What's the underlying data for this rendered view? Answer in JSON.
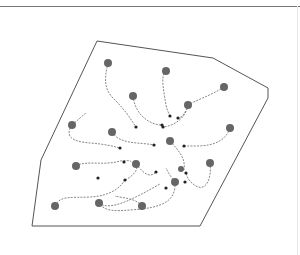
{
  "diagram": {
    "colors": {
      "boundary": "#555555",
      "path": "#888888",
      "source": "#666666",
      "sink": "#222222",
      "rule": "#777777"
    },
    "boundary_polygon": [
      [
        97,
        41
      ],
      [
        213,
        58
      ],
      [
        268,
        88
      ],
      [
        268,
        98
      ],
      [
        200,
        226
      ],
      [
        32,
        226
      ],
      [
        41,
        160
      ]
    ],
    "sources": [
      {
        "x": 108,
        "y": 63,
        "r": 4
      },
      {
        "x": 166,
        "y": 71,
        "r": 4
      },
      {
        "x": 133,
        "y": 96,
        "r": 4
      },
      {
        "x": 224,
        "y": 87,
        "r": 4
      },
      {
        "x": 188,
        "y": 105,
        "r": 4
      },
      {
        "x": 72,
        "y": 125,
        "r": 4
      },
      {
        "x": 112,
        "y": 132,
        "r": 4
      },
      {
        "x": 170,
        "y": 141,
        "r": 4
      },
      {
        "x": 230,
        "y": 128,
        "r": 4
      },
      {
        "x": 76,
        "y": 166,
        "r": 4
      },
      {
        "x": 136,
        "y": 164,
        "r": 4
      },
      {
        "x": 210,
        "y": 163,
        "r": 4
      },
      {
        "x": 55,
        "y": 206,
        "r": 4
      },
      {
        "x": 99,
        "y": 203,
        "r": 4
      },
      {
        "x": 142,
        "y": 206,
        "r": 4
      },
      {
        "x": 175,
        "y": 182,
        "r": 4
      },
      {
        "x": 181,
        "y": 169,
        "r": 3
      }
    ],
    "sinks": [
      {
        "x": 136,
        "y": 127
      },
      {
        "x": 162,
        "y": 125
      },
      {
        "x": 170,
        "y": 116
      },
      {
        "x": 178,
        "y": 118
      },
      {
        "x": 163,
        "y": 127
      },
      {
        "x": 120,
        "y": 148
      },
      {
        "x": 154,
        "y": 145
      },
      {
        "x": 184,
        "y": 146
      },
      {
        "x": 125,
        "y": 180
      },
      {
        "x": 186,
        "y": 173
      },
      {
        "x": 185,
        "y": 182
      },
      {
        "x": 166,
        "y": 188
      },
      {
        "x": 156,
        "y": 172
      },
      {
        "x": 98,
        "y": 178
      },
      {
        "x": 124,
        "y": 162
      }
    ],
    "paths": [
      "M108,63 C104,80 104,90 115,100 C125,110 130,118 136,127",
      "M166,71 C160,75 164,92 166,105 C167,110 169,114 170,116",
      "M133,96 C135,115 150,125 162,125",
      "M224,87 C210,96 196,100 188,105",
      "M188,105 C186,112 182,118 178,118",
      "M188,105 C186,118 174,126 163,127",
      "M72,125 C78,120 82,116 86,113",
      "M72,125 C62,140 80,142 90,143 C104,144 112,146 120,148",
      "M112,132 C120,145 140,142 154,145",
      "M230,128 C226,140 215,146 196,146 L184,146",
      "M170,141 C178,150 186,158 184,170",
      "M76,166 C86,160 104,166 120,161 C130,160 131,161 131,162",
      "M136,164 C145,175 150,178 156,172",
      "M136,164 C140,170 130,178 125,180",
      "M210,163 C212,178 206,192 196,186 C190,182 188,180 186,173",
      "M55,206 C60,195 72,198 90,197 C110,196 120,188 125,180",
      "M99,203 C110,212 135,198 160,184",
      "M142,206 C136,198 122,198 115,196",
      "M175,182 C176,200 165,208 130,210 C116,211 105,212 99,203",
      "M175,182 C170,176 168,172 166,168"
    ]
  }
}
